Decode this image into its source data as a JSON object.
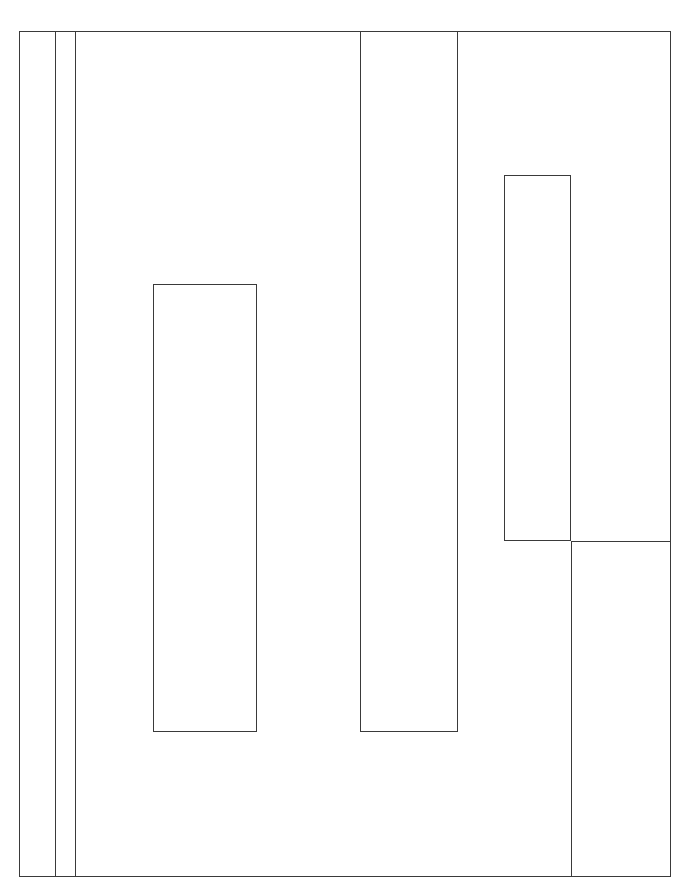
{
  "diagram": {
    "type": "line-drawing-rectangles",
    "stroke_color": "#3a3a3a",
    "background": "#ffffff",
    "elements": [
      {
        "name": "outer-frame",
        "kind": "rect",
        "x": 19,
        "y": 31,
        "w": 652,
        "h": 846
      },
      {
        "name": "left-strip-line-1",
        "kind": "vline",
        "x": 55,
        "y": 31,
        "h": 846
      },
      {
        "name": "left-strip-line-2",
        "kind": "vline",
        "x": 75,
        "y": 31,
        "h": 846
      },
      {
        "name": "left-inner-rect",
        "kind": "rect",
        "x": 153,
        "y": 284,
        "w": 104,
        "h": 448
      },
      {
        "name": "center-tall-rect",
        "kind": "rect",
        "x": 360,
        "y": 31,
        "w": 98,
        "h": 701
      },
      {
        "name": "right-upper-rect",
        "kind": "rect",
        "x": 504,
        "y": 175,
        "w": 67,
        "h": 366
      },
      {
        "name": "right-horizontal-line",
        "kind": "hline",
        "x": 571,
        "y": 541,
        "w": 100
      },
      {
        "name": "right-lower-vline",
        "kind": "vline",
        "x": 571,
        "y": 541,
        "h": 336
      }
    ]
  }
}
